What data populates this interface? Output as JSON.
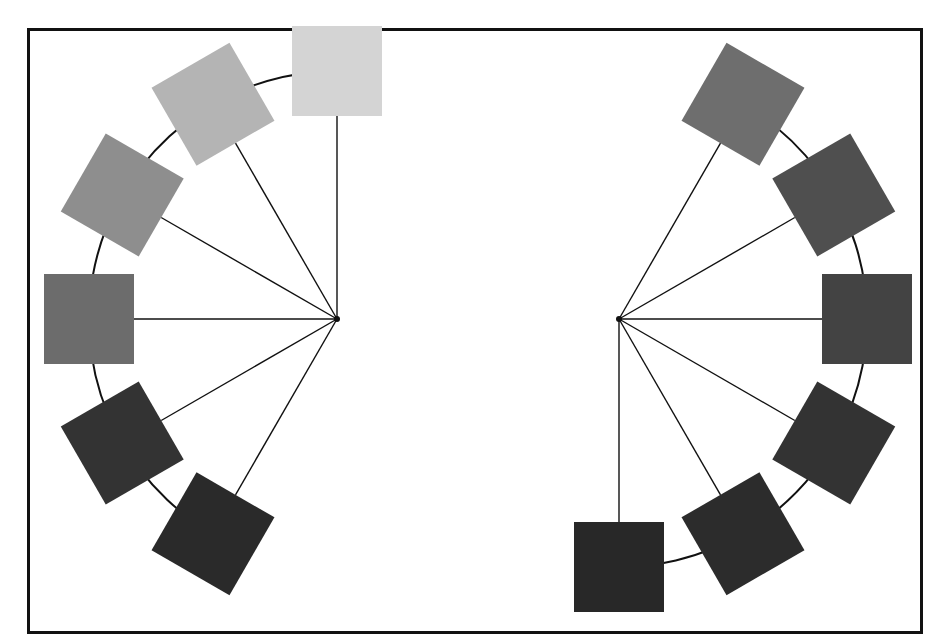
{
  "diagram": {
    "title": "",
    "frame": {
      "x": 27,
      "y": 28,
      "w": 893,
      "h": 603,
      "stroke": "#111111"
    },
    "groups": [
      {
        "name": "left-fan",
        "center": [
          337,
          319
        ],
        "radius": 248,
        "arc": {
          "from_deg": 95,
          "to_deg": 245
        },
        "squares": [
          {
            "angle_deg": 90,
            "color": "#d4d4d4"
          },
          {
            "angle_deg": 120,
            "color": "#b4b4b4"
          },
          {
            "angle_deg": 150,
            "color": "#8e8e8e"
          },
          {
            "angle_deg": 180,
            "color": "#6c6c6c"
          },
          {
            "angle_deg": 210,
            "color": "#333333"
          },
          {
            "angle_deg": 240,
            "color": "#2a2a2a"
          }
        ]
      },
      {
        "name": "right-fan",
        "center": [
          619,
          319
        ],
        "radius": 248,
        "arc": {
          "from_deg": -95,
          "to_deg": 55
        },
        "squares": [
          {
            "angle_deg": 60,
            "color": "#6e6e6e"
          },
          {
            "angle_deg": 30,
            "color": "#4f4f4f"
          },
          {
            "angle_deg": 0,
            "color": "#434343"
          },
          {
            "angle_deg": -30,
            "color": "#333333"
          },
          {
            "angle_deg": -60,
            "color": "#2c2c2c"
          },
          {
            "angle_deg": -90,
            "color": "#282828"
          }
        ]
      }
    ],
    "square_size": 90,
    "line_color": "#111111"
  }
}
